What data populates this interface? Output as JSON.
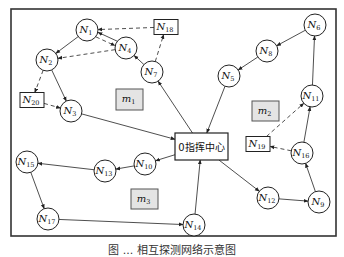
{
  "diagram": {
    "frame": {
      "x": 11,
      "y": 9,
      "w": 325,
      "h": 227
    },
    "center": {
      "id": "0",
      "label": "0指挥中心",
      "x": 175,
      "y": 133,
      "w": 53,
      "h": 27
    },
    "regions": [
      {
        "id": "m1",
        "base": "m",
        "sub": "1",
        "x": 116,
        "y": 89,
        "w": 27,
        "h": 21
      },
      {
        "id": "m2",
        "base": "m",
        "sub": "2",
        "x": 252,
        "y": 101,
        "w": 27,
        "h": 20
      },
      {
        "id": "m3",
        "base": "m",
        "sub": "3",
        "x": 131,
        "y": 189,
        "w": 27,
        "h": 20
      }
    ],
    "nodes": [
      {
        "id": "N1",
        "base": "N",
        "sub": "1",
        "shape": "circle",
        "x": 87,
        "y": 30
      },
      {
        "id": "N2",
        "base": "N",
        "sub": "2",
        "shape": "circle",
        "x": 47,
        "y": 60
      },
      {
        "id": "N3",
        "base": "N",
        "sub": "3",
        "shape": "circle",
        "x": 71,
        "y": 111
      },
      {
        "id": "N4",
        "base": "N",
        "sub": "4",
        "shape": "circle",
        "x": 126,
        "y": 48
      },
      {
        "id": "N5",
        "base": "N",
        "sub": "5",
        "shape": "circle",
        "x": 229,
        "y": 76
      },
      {
        "id": "N6",
        "base": "N",
        "sub": "6",
        "shape": "circle",
        "x": 315,
        "y": 25
      },
      {
        "id": "N7",
        "base": "N",
        "sub": "7",
        "shape": "circle",
        "x": 152,
        "y": 72
      },
      {
        "id": "N8",
        "base": "N",
        "sub": "8",
        "shape": "circle",
        "x": 267,
        "y": 51
      },
      {
        "id": "N9",
        "base": "N",
        "sub": "9",
        "shape": "circle",
        "x": 319,
        "y": 202
      },
      {
        "id": "N10",
        "base": "N",
        "sub": "10",
        "shape": "circle",
        "x": 145,
        "y": 164
      },
      {
        "id": "N11",
        "base": "N",
        "sub": "11",
        "shape": "circle",
        "x": 312,
        "y": 96
      },
      {
        "id": "N12",
        "base": "N",
        "sub": "12",
        "shape": "circle",
        "x": 268,
        "y": 198
      },
      {
        "id": "N13",
        "base": "N",
        "sub": "13",
        "shape": "circle",
        "x": 105,
        "y": 171
      },
      {
        "id": "N14",
        "base": "N",
        "sub": "14",
        "shape": "circle",
        "x": 194,
        "y": 225
      },
      {
        "id": "N15",
        "base": "N",
        "sub": "15",
        "shape": "circle",
        "x": 27,
        "y": 162
      },
      {
        "id": "N16",
        "base": "N",
        "sub": "16",
        "shape": "circle",
        "x": 302,
        "y": 153
      },
      {
        "id": "N17",
        "base": "N",
        "sub": "17",
        "shape": "circle",
        "x": 48,
        "y": 219
      },
      {
        "id": "N18",
        "base": "N",
        "sub": "18",
        "shape": "box",
        "x": 166,
        "y": 27
      },
      {
        "id": "N19",
        "base": "N",
        "sub": "19",
        "shape": "box",
        "x": 258,
        "y": 144
      },
      {
        "id": "N20",
        "base": "N",
        "sub": "20",
        "shape": "box",
        "x": 32,
        "y": 100
      }
    ],
    "edges": [
      {
        "from": "N18",
        "to": "N1",
        "style": "dashed"
      },
      {
        "from": "N1",
        "to": "N2",
        "style": "solid"
      },
      {
        "from": "N1",
        "to": "N4",
        "style": "dashed"
      },
      {
        "from": "N4",
        "to": "N1",
        "style": "solid"
      },
      {
        "from": "N4",
        "to": "N2",
        "style": "dashed"
      },
      {
        "from": "N7",
        "to": "N4",
        "style": "solid"
      },
      {
        "from": "N7",
        "to": "N18",
        "style": "dashed"
      },
      {
        "from": "N2",
        "to": "N20",
        "style": "dashed"
      },
      {
        "from": "N2",
        "to": "N3",
        "style": "solid"
      },
      {
        "from": "N20",
        "to": "N3",
        "style": "dashed"
      },
      {
        "from": "N3",
        "to": "0",
        "style": "solid"
      },
      {
        "from": "0",
        "to": "N7",
        "style": "solid"
      },
      {
        "from": "N6",
        "to": "N8",
        "style": "solid"
      },
      {
        "from": "N8",
        "to": "N5",
        "style": "solid"
      },
      {
        "from": "N5",
        "to": "0",
        "style": "solid"
      },
      {
        "from": "N11",
        "to": "N6",
        "style": "solid"
      },
      {
        "from": "N16",
        "to": "N11",
        "style": "solid"
      },
      {
        "from": "N19",
        "to": "N11",
        "style": "dashed"
      },
      {
        "from": "N16",
        "to": "N19",
        "style": "dashed"
      },
      {
        "from": "N9",
        "to": "N16",
        "style": "solid"
      },
      {
        "from": "N12",
        "to": "N9",
        "style": "solid"
      },
      {
        "from": "0",
        "to": "N12",
        "style": "solid"
      },
      {
        "from": "0",
        "to": "N10",
        "style": "solid"
      },
      {
        "from": "N10",
        "to": "N13",
        "style": "solid"
      },
      {
        "from": "N13",
        "to": "N15",
        "style": "solid"
      },
      {
        "from": "N15",
        "to": "N17",
        "style": "solid"
      },
      {
        "from": "N17",
        "to": "N14",
        "style": "solid"
      },
      {
        "from": "N14",
        "to": "0",
        "style": "solid"
      }
    ]
  },
  "caption": "图 ... 相互探测网络示意图"
}
